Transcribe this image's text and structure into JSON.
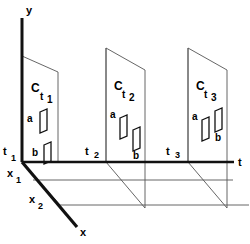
{
  "figure": {
    "title": "",
    "background_color": "#ffffff",
    "ink_color": "#000000",
    "thin_line_color": "#555555",
    "axes": {
      "vertical": {
        "label": "y",
        "name": "y-axis"
      },
      "horizontal": {
        "label": "t",
        "name": "t-axis"
      },
      "depth": {
        "label": "x",
        "name": "x-axis"
      }
    },
    "depth_ticks": [
      {
        "label": "x",
        "subscript": "1"
      },
      {
        "label": "x",
        "subscript": "2"
      }
    ],
    "time_ticks": [
      {
        "label": "t",
        "subscript": "1"
      },
      {
        "label": "t",
        "subscript": "2"
      },
      {
        "label": "t",
        "subscript": "3"
      }
    ],
    "planes": [
      {
        "label": "C",
        "sub_t": "t",
        "sub_n": "1",
        "objects": [
          {
            "label": "a"
          },
          {
            "label": "b"
          }
        ]
      },
      {
        "label": "C",
        "sub_t": "t",
        "sub_n": "2",
        "objects": [
          {
            "label": "a"
          },
          {
            "label": "b"
          }
        ]
      },
      {
        "label": "C",
        "sub_t": "t",
        "sub_n": "3",
        "objects": [
          {
            "label": "a"
          },
          {
            "label": "b"
          }
        ]
      }
    ]
  }
}
